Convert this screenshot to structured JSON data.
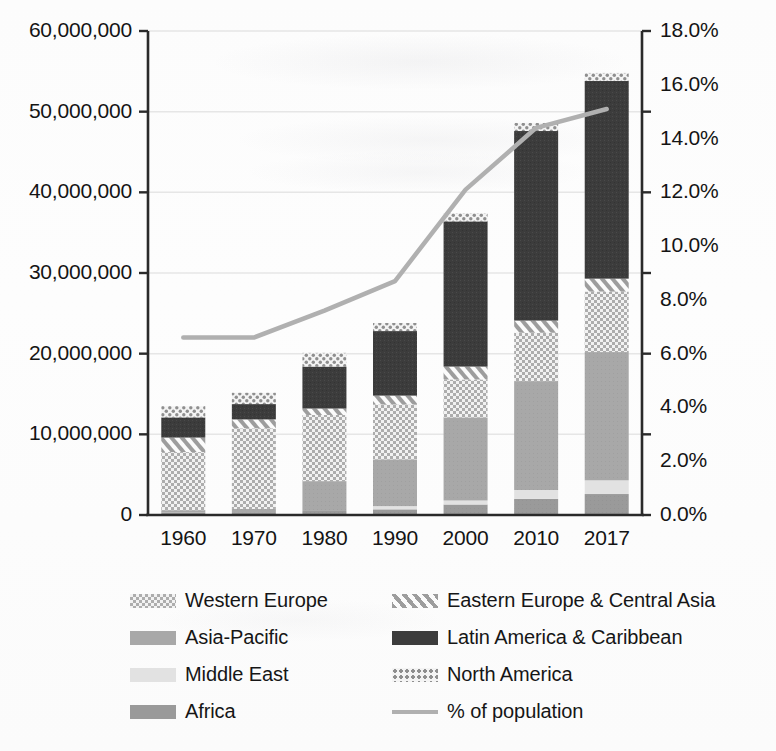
{
  "chart_data": {
    "type": "bar",
    "title": "",
    "subtitle": "",
    "xlabel": "",
    "ylabel": "",
    "y2label": "",
    "stacked": true,
    "grid": true,
    "legend_position": "bottom",
    "categories": [
      "1960",
      "1970",
      "1980",
      "1990",
      "2000",
      "2010",
      "2017"
    ],
    "ylim": [
      0,
      60000000
    ],
    "yticks": [
      0,
      10000000,
      20000000,
      30000000,
      40000000,
      50000000,
      60000000
    ],
    "ytick_labels": [
      "0",
      "10,000,000",
      "20,000,000",
      "30,000,000",
      "40,000,000",
      "50,000,000",
      "60,000,000"
    ],
    "y2lim": [
      0,
      18
    ],
    "y2ticks": [
      0.0,
      2.0,
      4.0,
      6.0,
      8.0,
      10.0,
      12.0,
      14.0,
      16.0,
      18.0
    ],
    "y2tick_labels": [
      "0.0%",
      "2.0%",
      "4.0%",
      "6.0%",
      "8.0%",
      "10.0%",
      "12.0%",
      "14.0%",
      "16.0%",
      "18.0%"
    ],
    "series": [
      {
        "name": "Africa",
        "pattern": "solid-medium-gray",
        "color": "#9a9a9a",
        "values": [
          300000,
          350000,
          500000,
          700000,
          1300000,
          2000000,
          2600000
        ]
      },
      {
        "name": "Middle East",
        "pattern": "solid-light-gray",
        "color": "#e2e2e2",
        "values": [
          0,
          0,
          0,
          400000,
          500000,
          1100000,
          1700000
        ]
      },
      {
        "name": "Asia-Pacific",
        "pattern": "solid-gray",
        "color": "#a8a8a8",
        "values": [
          300000,
          400000,
          3700000,
          5800000,
          10300000,
          13500000,
          15900000
        ]
      },
      {
        "name": "Western Europe",
        "pattern": "checkerboard",
        "color": "#c8c8c8",
        "values": [
          7200000,
          10000000,
          8200000,
          6800000,
          4700000,
          6000000,
          7500000
        ]
      },
      {
        "name": "Eastern Europe & Central Asia",
        "pattern": "diagonal-stripe",
        "color": "#d8d8d8",
        "values": [
          1800000,
          1100000,
          800000,
          1100000,
          1600000,
          1500000,
          1600000
        ]
      },
      {
        "name": "Latin America & Caribbean",
        "pattern": "solid-dark",
        "color": "#3c3c3c",
        "values": [
          2500000,
          1900000,
          5200000,
          8000000,
          18000000,
          23500000,
          24500000
        ]
      },
      {
        "name": "North America",
        "pattern": "dotted",
        "color": "#cfcfcf",
        "values": [
          1400000,
          1400000,
          1700000,
          1000000,
          1000000,
          1000000,
          1000000
        ]
      }
    ],
    "line_series": {
      "name": "% of population",
      "color": "#b0b0b0",
      "axis": "right",
      "values": [
        6.6,
        6.6,
        7.6,
        8.7,
        12.1,
        14.4,
        15.1
      ]
    },
    "bar_totals": [
      13500000,
      15150000,
      20100000,
      23800000,
      37400000,
      48600000,
      54800000
    ]
  },
  "legend": {
    "entries": [
      {
        "label": "Western Europe",
        "swatch": "checkerboard"
      },
      {
        "label": "Eastern Europe & Central Asia",
        "swatch": "diagonal-stripe"
      },
      {
        "label": "Asia-Pacific",
        "swatch": "solid-gray"
      },
      {
        "label": "Latin America & Caribbean",
        "swatch": "solid-dark"
      },
      {
        "label": "Middle East",
        "swatch": "solid-light-gray"
      },
      {
        "label": "North America",
        "swatch": "dotted"
      },
      {
        "label": "Africa",
        "swatch": "solid-medium-gray"
      },
      {
        "label": "% of population",
        "swatch": "line"
      }
    ]
  },
  "colors": {
    "axis": "#2a2a2a",
    "grid": "#e6e6e6",
    "line": "#b0b0b0",
    "dark": "#3c3c3c",
    "gray": "#a8a8a8",
    "light_gray": "#e2e2e2",
    "medium_gray": "#9a9a9a",
    "text": "#141414"
  }
}
